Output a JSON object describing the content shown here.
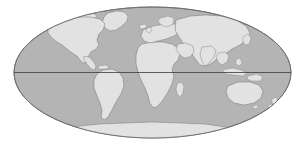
{
  "figure": {
    "name": "world-map",
    "projection": "Mollweide",
    "background_color": "#ffffff"
  },
  "chart_data": {
    "type": "map",
    "title": "",
    "projection": "Mollweide",
    "ellipse": {
      "center_x": 152.5,
      "center_y": 72.5,
      "radius_x": 138.5,
      "radius_y": 65.5
    },
    "colors": {
      "background": "#ffffff",
      "ocean": "#b4b4b4",
      "land": "#e2e2e2",
      "coastline": "#7a7a7a",
      "outline": "#6e6e6e",
      "equator": "#3a3a3a"
    },
    "graticule": {
      "equator_visible": true,
      "equator_y": 72.5,
      "other_lines_visible": false
    },
    "landmasses": [
      {
        "name": "North America",
        "label": "north-america"
      },
      {
        "name": "Greenland",
        "label": "greenland"
      },
      {
        "name": "South America",
        "label": "south-america"
      },
      {
        "name": "Africa",
        "label": "africa"
      },
      {
        "name": "Europe",
        "label": "europe"
      },
      {
        "name": "Asia",
        "label": "asia"
      },
      {
        "name": "Australia",
        "label": "australia"
      },
      {
        "name": "Antarctica",
        "label": "antarctica"
      },
      {
        "name": "Madagascar",
        "label": "madagascar"
      },
      {
        "name": "Indonesia",
        "label": "indonesia"
      },
      {
        "name": "Japan",
        "label": "japan"
      },
      {
        "name": "New Zealand",
        "label": "new-zealand"
      },
      {
        "name": "British Isles",
        "label": "british-isles"
      },
      {
        "name": "Iceland",
        "label": "iceland"
      }
    ]
  }
}
